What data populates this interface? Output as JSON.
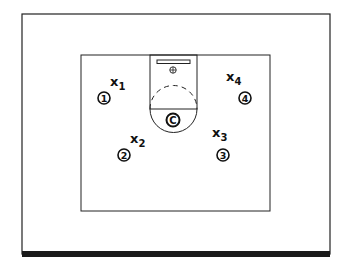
{
  "diagram": {
    "title": "",
    "offense": [
      {
        "id": "1",
        "label": "1"
      },
      {
        "id": "2",
        "label": "2"
      },
      {
        "id": "3",
        "label": "3"
      },
      {
        "id": "4",
        "label": "4"
      },
      {
        "id": "C",
        "label": "C"
      }
    ],
    "defense": [
      {
        "id": "x1",
        "letter": "X",
        "sub": "1"
      },
      {
        "id": "x2",
        "letter": "X",
        "sub": "2"
      },
      {
        "id": "x3",
        "letter": "X",
        "sub": "3"
      },
      {
        "id": "x4",
        "letter": "X",
        "sub": "4"
      }
    ],
    "colors": {
      "ink": "#111111",
      "background": "#ffffff"
    }
  }
}
